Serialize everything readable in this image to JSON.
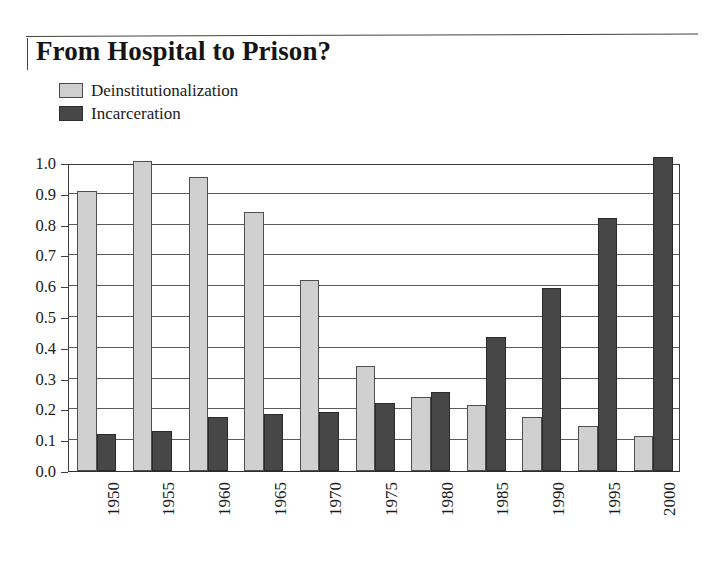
{
  "title": "From Hospital to Prison?",
  "legend": {
    "position": "top-left",
    "items": [
      {
        "label": "Deinstitutionalization",
        "color": "#d0d0d0",
        "swatch": "light-swatch"
      },
      {
        "label": "Incarceration",
        "color": "#474747",
        "swatch": "dark-swatch"
      }
    ]
  },
  "chart_data": {
    "type": "bar",
    "title": "From Hospital to Prison?",
    "xlabel": "",
    "ylabel": "",
    "ylim": [
      0.0,
      1.0
    ],
    "grid": true,
    "legend_position": "top-left",
    "categories": [
      "1950",
      "1955",
      "1960",
      "1965",
      "1970",
      "1975",
      "1980",
      "1985",
      "1990",
      "1995",
      "2000"
    ],
    "ytick_labels": [
      "0.0",
      "0.1",
      "0.2",
      "0.3",
      "0.4",
      "0.5",
      "0.6",
      "0.7",
      "0.8",
      "0.9",
      "1.0"
    ],
    "ytick_values": [
      0.0,
      0.1,
      0.2,
      0.3,
      0.4,
      0.5,
      0.6,
      0.7,
      0.8,
      0.9,
      1.0
    ],
    "series": [
      {
        "name": "Deinstitutionalization",
        "color": "#d0d0d0",
        "values": [
          0.91,
          1.005,
          0.955,
          0.84,
          0.62,
          0.34,
          0.24,
          0.215,
          0.175,
          0.145,
          0.115
        ]
      },
      {
        "name": "Incarceration",
        "color": "#474747",
        "values": [
          0.12,
          0.13,
          0.175,
          0.185,
          0.19,
          0.22,
          0.255,
          0.435,
          0.595,
          0.82,
          1.02
        ]
      }
    ]
  },
  "colors": {
    "light_bar": "#d0d0d0",
    "dark_bar": "#474747",
    "gridline": "#5b5b57",
    "axis": "#3f3f3f",
    "background": "#ffffff",
    "text": "#1a1a1a"
  }
}
